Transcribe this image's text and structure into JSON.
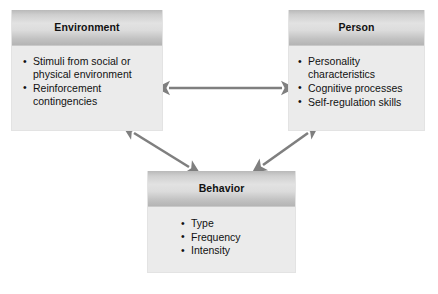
{
  "diagram": {
    "type": "triadic-reciprocal-determinism",
    "background_color": "#ffffff",
    "arrow_color": "#7f7f7f",
    "box_fill_color": "#ebebeb",
    "header_gradient_from": "#b9b9b9",
    "header_gradient_to": "#b4b4b4",
    "nodes": [
      {
        "id": "environment",
        "title": "Environment",
        "items": [
          "Stimuli from social or physical environment",
          "Reinforcement contingencies"
        ]
      },
      {
        "id": "person",
        "title": "Person",
        "items": [
          "Personality characteristics",
          "Cognitive processes",
          "Self-regulation skills"
        ]
      },
      {
        "id": "behavior",
        "title": "Behavior",
        "items": [
          "Type",
          "Frequency",
          "Intensity"
        ]
      }
    ],
    "connectors": [
      {
        "id": "environment-person",
        "from": "environment",
        "to": "person",
        "style": "double-headed-arrow",
        "orientation": "horizontal"
      },
      {
        "id": "environment-behavior",
        "from": "environment",
        "to": "behavior",
        "style": "double-headed-arrow",
        "orientation": "diagonal"
      },
      {
        "id": "person-behavior",
        "from": "person",
        "to": "behavior",
        "style": "double-headed-arrow",
        "orientation": "diagonal"
      }
    ]
  }
}
